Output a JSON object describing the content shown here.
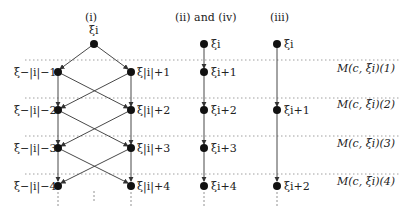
{
  "headers": {
    "i": "(i)",
    "ii_iv": "(ii) and (iv)",
    "iii": "(iii)"
  },
  "col_i": {
    "top": "ξi",
    "left": [
      "ξ−|i|−1",
      "ξ−|i|−2",
      "ξ−|i|−3",
      "ξ−|i|−4"
    ],
    "right": [
      "ξ|i|+1",
      "ξ|i|+2",
      "ξ|i|+3",
      "ξ|i|+4"
    ]
  },
  "col_ii_iv": [
    "ξi",
    "ξi+1",
    "ξi+2",
    "ξi+3",
    "ξi+4"
  ],
  "col_iii": [
    "ξi",
    "ξi+1",
    "ξi+2"
  ],
  "levels": [
    "M(c, ξi)(1)",
    "M(c, ξi)(2)",
    "M(c, ξi)(3)",
    "M(c, ξi)(4)"
  ]
}
